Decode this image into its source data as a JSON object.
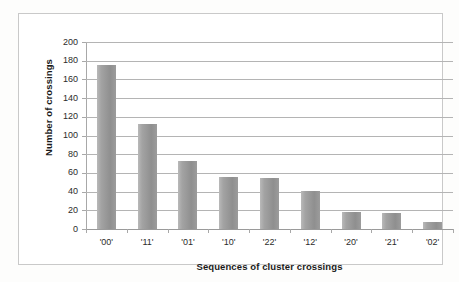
{
  "chart_data": {
    "type": "bar",
    "title": "",
    "xlabel": "Sequences of cluster crossings",
    "ylabel": "Number of crossings",
    "categories": [
      "'00'",
      "'11'",
      "'01'",
      "'10'",
      "'22'",
      "'12'",
      "'20'",
      "'21'",
      "'02'"
    ],
    "values": [
      175,
      112,
      73,
      56,
      55,
      41,
      18,
      17,
      7
    ],
    "ylim": [
      0,
      200
    ],
    "ytick_step": 20,
    "yticks": [
      200,
      180,
      160,
      140,
      120,
      100,
      80,
      60,
      40,
      20,
      0
    ],
    "grid": "horizontal",
    "legend": "none",
    "series": [
      {
        "name": "Number of crossings",
        "values": [
          175,
          112,
          73,
          56,
          55,
          41,
          18,
          17,
          7
        ],
        "color": "#999999"
      }
    ]
  },
  "colors": {
    "bar_fill": "#999999",
    "gridline": "#b4b4b4",
    "frame": "#c9c9c9",
    "axis": "#a8a8a8",
    "text": "#1a1a1a",
    "background": "#ffffff"
  }
}
